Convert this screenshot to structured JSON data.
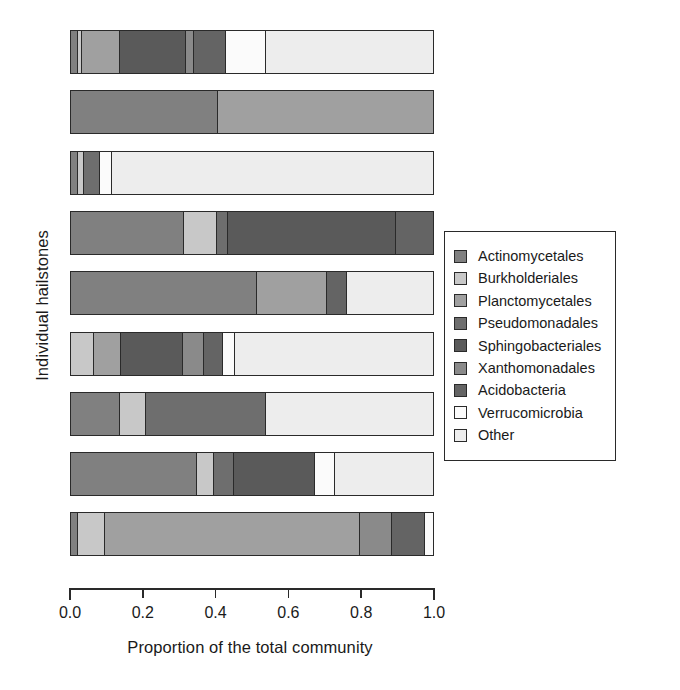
{
  "chart_data": {
    "type": "bar",
    "orientation": "horizontal",
    "stacked": true,
    "title": "",
    "xlabel": "Proportion of the total community",
    "ylabel": "Individual hailstones",
    "xlim": [
      0.0,
      1.0
    ],
    "xticks": [
      "0.0",
      "0.2",
      "0.4",
      "0.6",
      "0.8",
      "1.0"
    ],
    "xtick_values": [
      0.0,
      0.2,
      0.4,
      0.6,
      0.8,
      1.0
    ],
    "grid": false,
    "legend_position": "right",
    "categories": [
      "Hailstone 1",
      "Hailstone 2",
      "Hailstone 3",
      "Hailstone 4",
      "Hailstone 5",
      "Hailstone 6",
      "Hailstone 7",
      "Hailstone 8",
      "Hailstone 9"
    ],
    "series": [
      {
        "name": "Actinomycetales",
        "color": "#808080",
        "values": [
          0.018,
          0.405,
          0.02,
          0.31,
          0.51,
          0.0,
          0.135,
          0.345,
          0.02
        ]
      },
      {
        "name": "Burkholderiales",
        "color": "#c8c8c8",
        "values": [
          0.012,
          0.0,
          0.015,
          0.092,
          0.0,
          0.063,
          0.072,
          0.048,
          0.074
        ]
      },
      {
        "name": "Planctomycetales",
        "color": "#a0a0a0",
        "values": [
          0.105,
          0.595,
          0.0,
          0.0,
          0.192,
          0.075,
          0.0,
          0.0,
          0.7
        ]
      },
      {
        "name": "Pseudomonadales",
        "color": "#6e6e6e",
        "values": [
          0.0,
          0.0,
          0.045,
          0.03,
          0.0,
          0.0,
          0.33,
          0.055,
          0.0
        ]
      },
      {
        "name": "Sphingobacteriales",
        "color": "#5a5a5a",
        "values": [
          0.18,
          0.0,
          0.0,
          0.462,
          0.0,
          0.17,
          0.0,
          0.222,
          0.0
        ]
      },
      {
        "name": "Xanthomonadales",
        "color": "#8a8a8a",
        "values": [
          0.022,
          0.0,
          0.0,
          0.0,
          0.0,
          0.058,
          0.0,
          0.0,
          0.088
        ]
      },
      {
        "name": "Acidobacteria",
        "color": "#646464",
        "values": [
          0.09,
          0.0,
          0.0,
          0.106,
          0.055,
          0.052,
          0.0,
          0.0,
          0.09
        ]
      },
      {
        "name": "Verrucomicrobia",
        "color": "#fbfbfb",
        "values": [
          0.108,
          0.0,
          0.033,
          0.0,
          0.0,
          0.032,
          0.0,
          0.055,
          0.028
        ]
      },
      {
        "name": "Other",
        "color": "#ededed",
        "values": [
          0.465,
          0.0,
          0.887,
          0.0,
          0.243,
          0.55,
          0.463,
          0.275,
          0.0
        ]
      }
    ],
    "bars": [
      {
        "row": 1,
        "segments": [
          {
            "series": "Actinomycetales",
            "value": 0.018
          },
          {
            "series": "Burkholderiales",
            "value": 0.012
          },
          {
            "series": "Planctomycetales",
            "value": 0.105
          },
          {
            "series": "Sphingobacteriales",
            "value": 0.18
          },
          {
            "series": "Xanthomonadales",
            "value": 0.022
          },
          {
            "series": "Acidobacteria",
            "value": 0.09
          },
          {
            "series": "Verrucomicrobia",
            "value": 0.108
          },
          {
            "series": "Other",
            "value": 0.465
          }
        ]
      },
      {
        "row": 2,
        "segments": [
          {
            "series": "Actinomycetales",
            "value": 0.405
          },
          {
            "series": "Planctomycetales",
            "value": 0.595
          }
        ]
      },
      {
        "row": 3,
        "segments": [
          {
            "series": "Actinomycetales",
            "value": 0.02
          },
          {
            "series": "Burkholderiales",
            "value": 0.015
          },
          {
            "series": "Pseudomonadales",
            "value": 0.045
          },
          {
            "series": "Verrucomicrobia",
            "value": 0.033
          },
          {
            "series": "Other",
            "value": 0.887
          }
        ]
      },
      {
        "row": 4,
        "segments": [
          {
            "series": "Actinomycetales",
            "value": 0.31
          },
          {
            "series": "Burkholderiales",
            "value": 0.092
          },
          {
            "series": "Pseudomonadales",
            "value": 0.03
          },
          {
            "series": "Sphingobacteriales",
            "value": 0.462
          },
          {
            "series": "Acidobacteria",
            "value": 0.106
          }
        ]
      },
      {
        "row": 5,
        "segments": [
          {
            "series": "Actinomycetales",
            "value": 0.51
          },
          {
            "series": "Planctomycetales",
            "value": 0.192
          },
          {
            "series": "Acidobacteria",
            "value": 0.055
          },
          {
            "series": "Other",
            "value": 0.243
          }
        ]
      },
      {
        "row": 6,
        "segments": [
          {
            "series": "Burkholderiales",
            "value": 0.063
          },
          {
            "series": "Planctomycetales",
            "value": 0.075
          },
          {
            "series": "Sphingobacteriales",
            "value": 0.17
          },
          {
            "series": "Xanthomonadales",
            "value": 0.058
          },
          {
            "series": "Acidobacteria",
            "value": 0.052
          },
          {
            "series": "Verrucomicrobia",
            "value": 0.032
          },
          {
            "series": "Other",
            "value": 0.55
          }
        ]
      },
      {
        "row": 7,
        "segments": [
          {
            "series": "Actinomycetales",
            "value": 0.135
          },
          {
            "series": "Burkholderiales",
            "value": 0.072
          },
          {
            "series": "Pseudomonadales",
            "value": 0.33
          },
          {
            "series": "Sphingobacteriales",
            "value": 0.0
          },
          {
            "series": "Other",
            "value": 0.463
          }
        ]
      },
      {
        "row": 8,
        "segments": [
          {
            "series": "Actinomycetales",
            "value": 0.345
          },
          {
            "series": "Burkholderiales",
            "value": 0.048
          },
          {
            "series": "Pseudomonadales",
            "value": 0.055
          },
          {
            "series": "Sphingobacteriales",
            "value": 0.222
          },
          {
            "series": "Verrucomicrobia",
            "value": 0.055
          },
          {
            "series": "Other",
            "value": 0.275
          }
        ]
      },
      {
        "row": 9,
        "segments": [
          {
            "series": "Actinomycetales",
            "value": 0.02
          },
          {
            "series": "Burkholderiales",
            "value": 0.074
          },
          {
            "series": "Planctomycetales",
            "value": 0.7
          },
          {
            "series": "Xanthomonadales",
            "value": 0.088
          },
          {
            "series": "Acidobacteria",
            "value": 0.09
          },
          {
            "series": "Verrucomicrobia",
            "value": 0.028
          }
        ]
      }
    ]
  },
  "legend": {
    "items": [
      {
        "label": "Actinomycetales",
        "color": "#808080"
      },
      {
        "label": "Burkholderiales",
        "color": "#c8c8c8"
      },
      {
        "label": "Planctomycetales",
        "color": "#a0a0a0"
      },
      {
        "label": "Pseudomonadales",
        "color": "#6e6e6e"
      },
      {
        "label": "Sphingobacteriales",
        "color": "#5a5a5a"
      },
      {
        "label": "Xanthomonadales",
        "color": "#8a8a8a"
      },
      {
        "label": "Acidobacteria",
        "color": "#646464"
      },
      {
        "label": "Verrucomicrobia",
        "color": "#fbfbfb"
      },
      {
        "label": "Other",
        "color": "#ededed"
      }
    ]
  }
}
